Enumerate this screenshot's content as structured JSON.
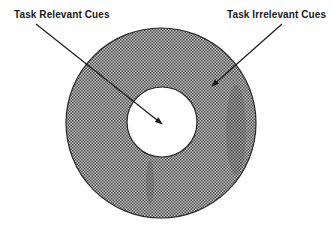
{
  "diagram": {
    "labels": {
      "task_relevant": "Task Relevant Cues",
      "task_irrelevant": "Task Irrelevant Cues"
    },
    "regions": {
      "outer_ring": {
        "represents": "Task Irrelevant Cues",
        "fill": "stippled gray"
      },
      "inner_circle": {
        "represents": "Task Relevant Cues",
        "fill": "white"
      }
    },
    "colors": {
      "ink": "#1a1a1a",
      "ring_dark": "#3a3a3a",
      "ring_light": "#bdbdbd",
      "background": "#ffffff"
    }
  }
}
